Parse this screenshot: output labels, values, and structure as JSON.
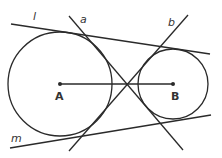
{
  "diagram": {
    "title": "",
    "colors": {
      "stroke": "#2a2a2a",
      "background": "#ffffff"
    },
    "circles": [
      {
        "name": "A",
        "label": "A",
        "cx": 60,
        "cy": 84,
        "r": 52
      },
      {
        "name": "B",
        "label": "B",
        "cx": 173,
        "cy": 84,
        "r": 35
      }
    ],
    "segment": {
      "from": "A",
      "to": "B"
    },
    "lines": [
      {
        "label": "l",
        "type": "external tangent",
        "x1": 11,
        "y1": 24,
        "x2": 210,
        "y2": 54
      },
      {
        "label": "m",
        "type": "external tangent",
        "x1": 10,
        "y1": 148,
        "x2": 211,
        "y2": 115
      },
      {
        "label": "a",
        "type": "internal tangent",
        "x1": 69,
        "y1": 16,
        "x2": 183,
        "y2": 150
      },
      {
        "label": "b",
        "type": "internal tangent",
        "x1": 188,
        "y1": 15,
        "x2": 69,
        "y2": 151
      }
    ],
    "labels": {
      "l": "l",
      "a": "a",
      "b": "b",
      "m": "m",
      "A": "A",
      "B": "B"
    }
  }
}
